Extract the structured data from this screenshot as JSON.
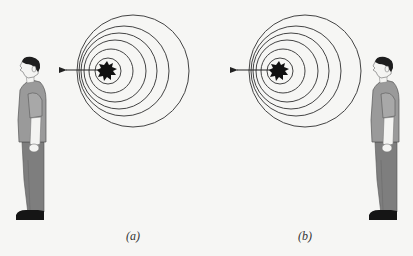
{
  "figure": {
    "colors": {
      "background": "#f6f6f4",
      "wavefront": "#444444",
      "source": "#111111",
      "arrow": "#222222",
      "shirt": "#9a9a9a",
      "pants": "#7e7e7e",
      "skin": "#f4f4f2",
      "hair": "#1e1e1e",
      "shoes": "#151515"
    },
    "panels": [
      {
        "label": "(a)",
        "source_center": [
          107,
          71
        ],
        "arrow_direction": "left",
        "arrow_tip": [
          64,
          70
        ],
        "wavefronts": [
          {
            "cx": 108,
            "cy": 71,
            "r": 13
          },
          {
            "cx": 111,
            "cy": 71,
            "r": 22
          },
          {
            "cx": 115,
            "cy": 71,
            "r": 31
          },
          {
            "cx": 119,
            "cy": 71,
            "r": 38
          },
          {
            "cx": 124,
            "cy": 71,
            "r": 45
          },
          {
            "cx": 133,
            "cy": 71,
            "r": 56
          }
        ],
        "observer_position": "left",
        "observer_facing": "left"
      },
      {
        "label": "(b)",
        "source_center": [
          279,
          71
        ],
        "arrow_direction": "left",
        "arrow_tip": [
          235,
          70
        ],
        "wavefronts": [
          {
            "cx": 280,
            "cy": 71,
            "r": 13
          },
          {
            "cx": 283,
            "cy": 71,
            "r": 22
          },
          {
            "cx": 287,
            "cy": 71,
            "r": 31
          },
          {
            "cx": 291,
            "cy": 71,
            "r": 38
          },
          {
            "cx": 296,
            "cy": 71,
            "r": 45
          },
          {
            "cx": 305,
            "cy": 71,
            "r": 56
          }
        ],
        "observer_position": "right",
        "observer_facing": "left"
      }
    ]
  }
}
